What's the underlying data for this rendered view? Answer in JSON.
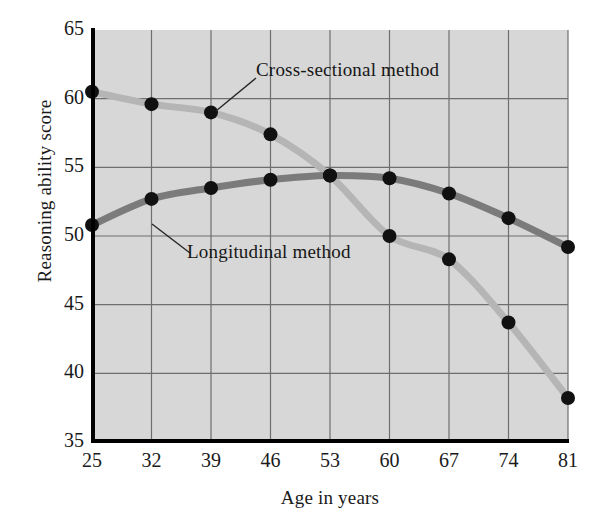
{
  "chart_data": {
    "type": "line",
    "title": "",
    "xlabel": "Age in years",
    "ylabel": "Reasoning ability score",
    "categories": [
      25,
      32,
      39,
      46,
      53,
      60,
      67,
      74,
      81
    ],
    "xtick_labels": [
      "25",
      "32",
      "39",
      "46",
      "53",
      "60",
      "67",
      "74",
      "81"
    ],
    "ytick_labels": [
      "35",
      "40",
      "45",
      "50",
      "55",
      "60",
      "65"
    ],
    "ytick_values": [
      35,
      40,
      45,
      50,
      55,
      60,
      65
    ],
    "xlim": [
      25,
      81
    ],
    "ylim": [
      35,
      65
    ],
    "grid": true,
    "legend_position": "inline-annotations",
    "series": [
      {
        "name": "Cross-sectional method",
        "color": "#b5b5b5",
        "marker_color": "#111111",
        "values": [
          60.5,
          59.6,
          59.0,
          57.4,
          54.4,
          50.0,
          48.3,
          43.7,
          38.2
        ]
      },
      {
        "name": "Longitudinal method",
        "color": "#7b7b7b",
        "marker_color": "#111111",
        "values": [
          50.8,
          52.7,
          53.5,
          54.1,
          54.4,
          54.2,
          53.1,
          51.3,
          49.2
        ]
      }
    ],
    "annotations": [
      {
        "text": "Cross-sectional method",
        "target_series": "Cross-sectional method",
        "target_x": 32
      },
      {
        "text": "Longitudinal method",
        "target_series": "Longitudinal method",
        "target_x": 25
      }
    ],
    "plot_background": "#d7d7d7",
    "axis_color": "#000000",
    "gridline_color": "#6e6e6e"
  }
}
